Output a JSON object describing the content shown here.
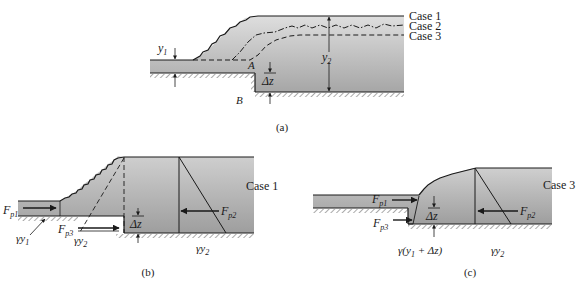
{
  "panel_a": {
    "caption": "(a)",
    "case1": "Case 1",
    "case2": "Case 2",
    "case3": "Case 3",
    "y1": "y",
    "y1_sub": "1",
    "y2": "y",
    "y2_sub": "2",
    "point_a": "A",
    "point_b": "B",
    "dz": "Δz"
  },
  "panel_b": {
    "caption": "(b)",
    "case_label": "Case 1",
    "fp1": "F",
    "fp1_sub": "p1",
    "fp2": "F",
    "fp2_sub": "p2",
    "fp3": "F",
    "fp3_sub": "p3",
    "gy1": "γy",
    "gy1_sub": "1",
    "gy2_left": "γy",
    "gy2_left_sub": "2",
    "gy2_right": "γy",
    "gy2_right_sub": "2",
    "dz": "Δz"
  },
  "panel_c": {
    "caption": "(c)",
    "case_label": "Case 3",
    "fp1": "F",
    "fp1_sub": "p1",
    "fp2": "F",
    "fp2_sub": "p2",
    "fp3": "F",
    "fp3_sub": "p3",
    "gy_expr": "γ(y",
    "gy_expr_sub": "1",
    "gy_expr_tail": " + Δz)",
    "gy2": "γy",
    "gy2_sub": "2",
    "dz": "Δz"
  },
  "colors": {
    "water_top": "#d9d9d9",
    "water_bottom": "#a9a9a9",
    "line": "#1a1a1a",
    "hatch": "#555555"
  }
}
